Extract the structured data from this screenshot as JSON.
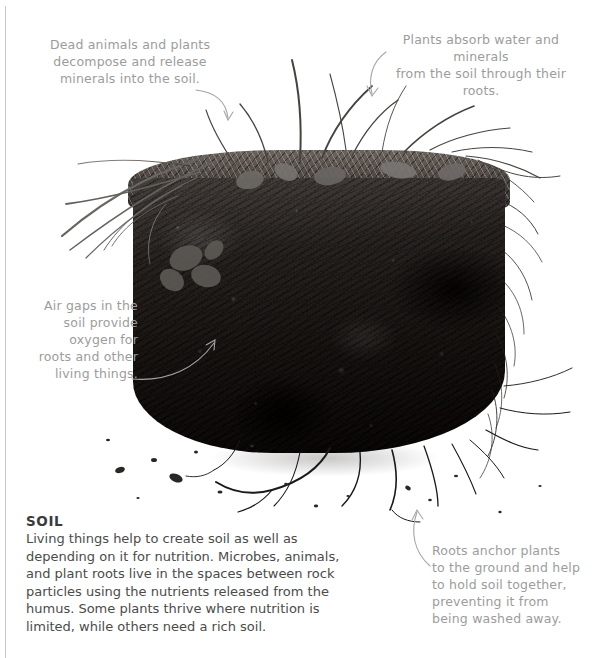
{
  "page": {
    "width": 598,
    "height": 658,
    "background_color": "#ffffff",
    "rule_color": "#c9c9c9"
  },
  "photo": {
    "alt_name": "soil-cross-section-photograph",
    "description": "Black and white photograph of a cut block of soil with grass, leaves and roots on top and dangling roots below",
    "palette": {
      "soil_dark": "#211e1c",
      "soil_mid": "#4a4542",
      "turf_light": "#6d6660",
      "white": "#ffffff"
    }
  },
  "annotations": [
    {
      "id": "dead-animals",
      "text": "Dead animals and plants\ndecompose and release\nminerals into the soil.",
      "color": "#9c9c9c",
      "arrow": "curved-down-right"
    },
    {
      "id": "plants-absorb",
      "text": "Plants absorb water and minerals\nfrom the soil through their roots.",
      "color": "#9c9c9c",
      "arrow": "curved-down-left"
    },
    {
      "id": "air-gaps",
      "text": "Air gaps in the\nsoil provide\noxygen for\nroots and other\nliving things.",
      "color": "#9c9c9c",
      "arrow": "curved-up-right"
    },
    {
      "id": "roots-anchor",
      "text": "Roots anchor plants\nto the ground and help\nto hold soil together,\npreventing it from\nbeing washed away.",
      "color": "#9c9c9c",
      "arrow": "curved-up-left"
    }
  ],
  "caption": {
    "title": "SOIL",
    "body": "Living things help to create soil as well as depending on it for nutrition. Microbes, animals, and plant roots live in the spaces between rock particles using the nutrients released from the humus. Some plants thrive where nutrition is limited, while others need a rich soil.",
    "title_color": "#3b3b3b",
    "body_color": "#4b4b4b"
  }
}
